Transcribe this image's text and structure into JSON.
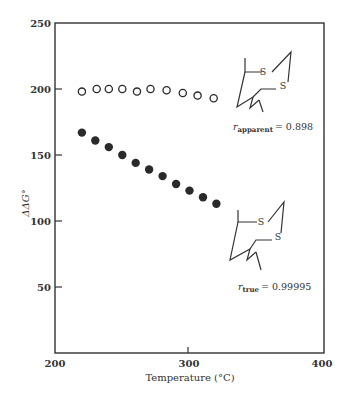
{
  "chart_data": {
    "type": "scatter",
    "title": "",
    "xlabel": "Temperature (°C)",
    "ylabel": "ΔΔG°",
    "xlim": [
      200,
      400
    ],
    "ylim": [
      0,
      250
    ],
    "xticks": [
      200,
      300,
      400
    ],
    "yticks": [
      50,
      100,
      150,
      200,
      250
    ],
    "grid": false,
    "legend": null,
    "series": [
      {
        "name": "apparent",
        "marker": "open-circle",
        "x": [
          220,
          231,
          240,
          250,
          261,
          271,
          283,
          295,
          306,
          318
        ],
        "y": [
          198,
          200,
          200,
          200,
          198,
          200,
          199,
          197,
          195,
          193
        ]
      },
      {
        "name": "true",
        "marker": "filled-circle",
        "x": [
          220,
          230,
          240,
          250,
          260,
          270,
          280,
          290,
          300,
          310,
          320
        ],
        "y": [
          167,
          161,
          156,
          150,
          144,
          139,
          134,
          128,
          123,
          118,
          113
        ]
      }
    ],
    "annotations": [
      {
        "text": "r_apparent = 0.898",
        "label_var": "r",
        "label_sub": "apparent",
        "label_value": "= 0.898",
        "near_series": "apparent"
      },
      {
        "text": "r_true = 0.99995",
        "label_var": "r",
        "label_sub": "true",
        "label_value": "= 0.99995",
        "near_series": "true"
      }
    ],
    "structures": [
      {
        "description": "1,2-dithiane ring skeletal structure with S atoms",
        "atoms": [
          "S",
          "S"
        ],
        "near_series": "apparent"
      },
      {
        "description": "1,2-dithiane ring skeletal structure with S atoms",
        "atoms": [
          "S",
          "S"
        ],
        "near_series": "true"
      }
    ]
  },
  "colors": {
    "ink": "#2a2a2a",
    "background": "#ffffff"
  }
}
